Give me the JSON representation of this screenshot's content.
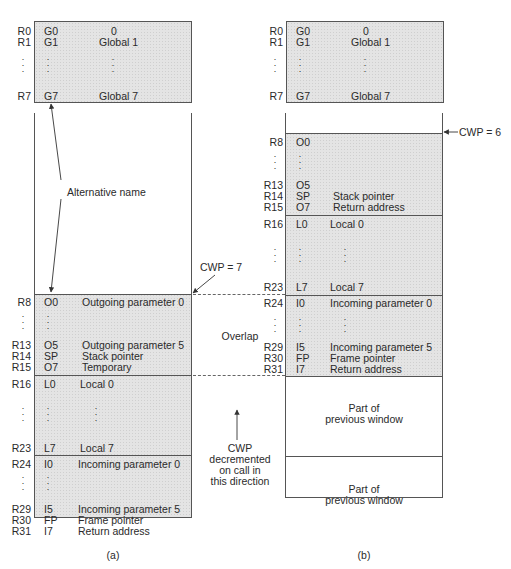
{
  "panel_a": {
    "caption": "(a)",
    "globals": [
      {
        "reg": "R0",
        "alt": "G0",
        "desc": "0"
      },
      {
        "reg": "R1",
        "alt": "G1",
        "desc": "Global 1"
      },
      {
        "reg": "R7",
        "alt": "G7",
        "desc": "Global 7"
      }
    ],
    "window": [
      {
        "reg": "R8",
        "alt": "O0",
        "desc": "Outgoing parameter 0"
      },
      {
        "reg": "R13",
        "alt": "O5",
        "desc": "Outgoing parameter 5"
      },
      {
        "reg": "R14",
        "alt": "SP",
        "desc": "Stack pointer"
      },
      {
        "reg": "R15",
        "alt": "O7",
        "desc": "Temporary"
      },
      {
        "reg": "R16",
        "alt": "L0",
        "desc": "Local 0"
      },
      {
        "reg": "R23",
        "alt": "L7",
        "desc": "Local 7"
      },
      {
        "reg": "R24",
        "alt": "I0",
        "desc": "Incoming parameter 0"
      },
      {
        "reg": "R29",
        "alt": "I5",
        "desc": "Incoming parameter 5"
      },
      {
        "reg": "R30",
        "alt": "FP",
        "desc": "Frame pointer"
      },
      {
        "reg": "R31",
        "alt": "I7",
        "desc": "Return address"
      }
    ],
    "cwp_label": "CWP = 7",
    "alt_name_label": "Alternative name"
  },
  "panel_b": {
    "caption": "(b)",
    "globals": [
      {
        "reg": "R0",
        "alt": "G0",
        "desc": "0"
      },
      {
        "reg": "R1",
        "alt": "G1",
        "desc": "Global 1"
      },
      {
        "reg": "R7",
        "alt": "G7",
        "desc": "Global 7"
      }
    ],
    "window": [
      {
        "reg": "R8",
        "alt": "O0",
        "desc": ""
      },
      {
        "reg": "R13",
        "alt": "O5",
        "desc": ""
      },
      {
        "reg": "R14",
        "alt": "SP",
        "desc": "Stack pointer"
      },
      {
        "reg": "R15",
        "alt": "O7",
        "desc": "Return address"
      },
      {
        "reg": "R16",
        "alt": "L0",
        "desc": "Local 0"
      },
      {
        "reg": "R23",
        "alt": "L7",
        "desc": "Local 7"
      },
      {
        "reg": "R24",
        "alt": "I0",
        "desc": "Incoming parameter 0"
      },
      {
        "reg": "R29",
        "alt": "I5",
        "desc": "Incoming parameter 5"
      },
      {
        "reg": "R30",
        "alt": "FP",
        "desc": "Frame pointer"
      },
      {
        "reg": "R31",
        "alt": "I7",
        "desc": "Return address"
      }
    ],
    "cwp_label": "CWP = 6",
    "previous_window_1": [
      "Part of",
      "previous window"
    ],
    "previous_window_2": [
      "Part of",
      "previous window"
    ]
  },
  "middle": {
    "overlap_label": "Overlap",
    "direction_label": [
      "CWP",
      "decremented",
      "on call in",
      "this direction"
    ]
  },
  "colors": {
    "shade": "#e4e4e4",
    "line": "#555555",
    "text": "#2a2a2a"
  }
}
